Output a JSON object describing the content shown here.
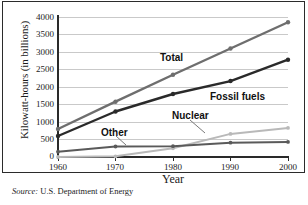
{
  "figure": {
    "source_prefix": "Source:",
    "source_text": "U.S. Department of Energy"
  },
  "chart_data": {
    "type": "line",
    "title": "",
    "xlabel": "Year",
    "ylabel": "Kilowatt-hours (in billions)",
    "x": [
      1960,
      1970,
      1980,
      1990,
      2000
    ],
    "categories": [
      "1960",
      "1970",
      "1980",
      "1990",
      "2000"
    ],
    "xlim": [
      1960,
      2000
    ],
    "ylim": [
      0,
      4000
    ],
    "yticks": [
      0,
      500,
      1000,
      1500,
      2000,
      2500,
      3000,
      3500,
      4000
    ],
    "ytick_labels": [
      "0",
      "500",
      "1000",
      "1500",
      "2000",
      "2500",
      "3000",
      "3500",
      "4000"
    ],
    "grid": "horizontal",
    "legend_position": "inline-labels",
    "series": [
      {
        "name": "Total",
        "label": "Total",
        "color": "#6e6e6e",
        "values": [
          800,
          1580,
          2350,
          3100,
          3850
        ]
      },
      {
        "name": "Fossil fuels",
        "label": "Fossil fuels",
        "color": "#2a2a2a",
        "values": [
          600,
          1300,
          1800,
          2170,
          2780
        ]
      },
      {
        "name": "Other",
        "label": "Other",
        "color": "#5a5a5a",
        "values": [
          150,
          300,
          310,
          410,
          430
        ]
      },
      {
        "name": "Nuclear",
        "label": "Nuclear",
        "color": "#b9b9b9",
        "values": [
          0,
          20,
          250,
          660,
          830
        ]
      }
    ],
    "annotations": [
      {
        "text": "Total",
        "for": "Total",
        "leader": false
      },
      {
        "text": "Fossil fuels",
        "for": "Fossil fuels",
        "leader": false
      },
      {
        "text": "Nuclear",
        "for": "Nuclear",
        "leader": true
      },
      {
        "text": "Other",
        "for": "Other",
        "leader": true
      }
    ]
  }
}
